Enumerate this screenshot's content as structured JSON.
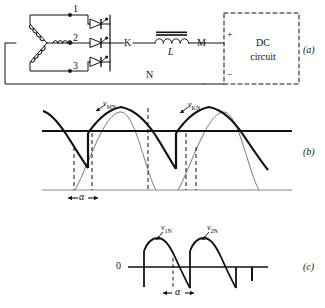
{
  "figure": {
    "type": "three-phase-half-wave-controlled-rectifier",
    "panels": [
      {
        "id": "a",
        "label": "(a)",
        "caption": "circuit schematic"
      },
      {
        "id": "b",
        "label": "(b)",
        "caption": "output voltage waveform"
      },
      {
        "id": "c",
        "label": "(c)",
        "caption": "phase voltage waveform"
      }
    ]
  },
  "circuit": {
    "phase_terminals": [
      "1",
      "2",
      "3"
    ],
    "node_k": "K",
    "node_m": "M",
    "node_n": "N",
    "inductor_label": "L",
    "dc_box": {
      "line1": "DC",
      "line2": "circuit"
    },
    "polarity_plus": "+",
    "polarity_minus": "−",
    "thyristor_count": 3,
    "transformer": "wye-connected three-phase secondary"
  },
  "waveform_b": {
    "label_left": "v",
    "label_left_sub": "MN",
    "label_right": "v",
    "label_right_sub": "KN",
    "alpha": "α",
    "axis": "thick horizontal axis"
  },
  "waveform_c": {
    "zero": "0",
    "label_left": "v",
    "label_left_sub": "1N",
    "label_right": "v",
    "label_right_sub": "2N",
    "alpha": "α"
  },
  "colors": {
    "line": "#111111",
    "thin": "#444444",
    "background": "#ffffff"
  }
}
